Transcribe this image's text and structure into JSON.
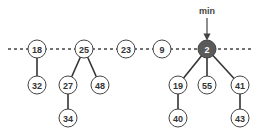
{
  "diagram": {
    "type": "fibonacci-heap",
    "min_label": "min",
    "min_pointer_target": "2",
    "root_list": [
      "18",
      "25",
      "23",
      "9",
      "2"
    ],
    "nodes": [
      {
        "id": "n18",
        "key": "18",
        "x": 37,
        "y": 49,
        "min": false
      },
      {
        "id": "n25",
        "key": "25",
        "x": 84,
        "y": 49,
        "min": false
      },
      {
        "id": "n23",
        "key": "23",
        "x": 126,
        "y": 49,
        "min": false
      },
      {
        "id": "n9",
        "key": "9",
        "x": 162,
        "y": 49,
        "min": false
      },
      {
        "id": "n2",
        "key": "2",
        "x": 207,
        "y": 49,
        "min": true
      },
      {
        "id": "n32",
        "key": "32",
        "x": 37,
        "y": 85,
        "min": false
      },
      {
        "id": "n27",
        "key": "27",
        "x": 68,
        "y": 85,
        "min": false
      },
      {
        "id": "n48",
        "key": "48",
        "x": 100,
        "y": 85,
        "min": false
      },
      {
        "id": "n34",
        "key": "34",
        "x": 68,
        "y": 118,
        "min": false
      },
      {
        "id": "n19",
        "key": "19",
        "x": 178,
        "y": 85,
        "min": false
      },
      {
        "id": "n55",
        "key": "55",
        "x": 207,
        "y": 85,
        "min": false
      },
      {
        "id": "n41",
        "key": "41",
        "x": 240,
        "y": 85,
        "min": false
      },
      {
        "id": "n40",
        "key": "40",
        "x": 178,
        "y": 118,
        "min": false
      },
      {
        "id": "n43",
        "key": "43",
        "x": 240,
        "y": 118,
        "min": false
      }
    ],
    "edges": [
      [
        "18",
        "32"
      ],
      [
        "25",
        "27"
      ],
      [
        "25",
        "48"
      ],
      [
        "27",
        "34"
      ],
      [
        "2",
        "19"
      ],
      [
        "2",
        "55"
      ],
      [
        "2",
        "41"
      ],
      [
        "19",
        "40"
      ],
      [
        "41",
        "43"
      ]
    ],
    "colors": {
      "min_node_fill": "#5a5a5a",
      "node_stroke": "#444444",
      "background": "#ffffff"
    }
  }
}
